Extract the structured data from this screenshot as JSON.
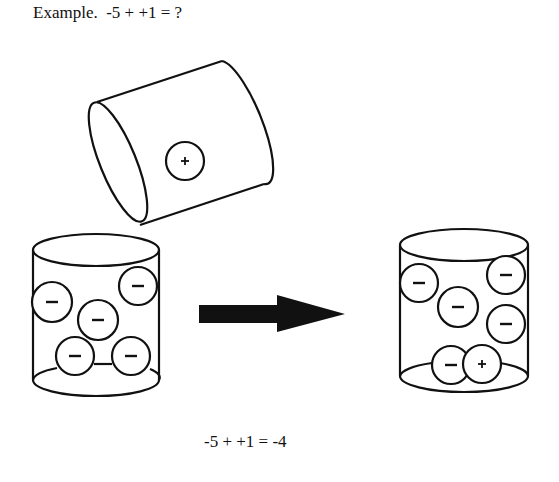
{
  "title": "Example.  -5 + +1 = ?",
  "result": "-5 + +1 = -4",
  "pouring_cylinder": {
    "contents": [
      "+"
    ]
  },
  "start_cylinder": {
    "contents": [
      "-",
      "-",
      "-",
      "-",
      "-"
    ]
  },
  "end_cylinder": {
    "contents": [
      "-",
      "-",
      "-",
      "-",
      "-",
      "+"
    ]
  },
  "arrow": {
    "direction": "right",
    "meaning": "results-in"
  }
}
